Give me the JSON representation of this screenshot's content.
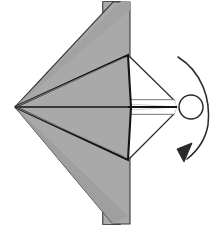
{
  "figure": {
    "title": "Origami paper-airplane fold step with rotation arrow",
    "canvas": {
      "width": 220,
      "height": 235,
      "background": "#ffffff"
    },
    "colors": {
      "paper_front_gray": "#a9a9a9",
      "paper_mid_gray": "#9c9c9c",
      "paper_shadow_gray": "#8f8f8f",
      "paper_back_white": "#ffffff",
      "outline_dark": "#1a1a1a",
      "outline_soft": "#555555",
      "crease_light": "#c9c9c9",
      "arrow_stroke": "#2a2a2a"
    },
    "elements": {
      "back_flap_band": {
        "label": "vertical back flap band",
        "points": "103,2 120,2 120,224 103,224"
      },
      "back_flap_band_shade": {
        "label": "vertical back flap band inner shade",
        "points": "103,2 116,2 116,224 103,224"
      },
      "upper_wing": {
        "label": "upper large gray wing",
        "points": "15,107 113,2 129,2 129,55"
      },
      "lower_wing": {
        "label": "lower large gray wing",
        "points": "15,107 129,160 129,224 113,224"
      },
      "upper_body_panel": {
        "label": "upper gray body panel",
        "points": "15,107 128,55 130,107"
      },
      "lower_body_panel": {
        "label": "lower gray body panel",
        "points": "15,107 130,107 128,160"
      },
      "nose_white_upper": {
        "label": "upper white inner nose panel",
        "points": "128,55 172,98 130,98"
      },
      "nose_white_lower": {
        "label": "lower white inner nose panel",
        "points": "128,160 130,116 172,116"
      },
      "nose_white_mid_upper": {
        "label": "upper thin white sliver",
        "points": "130,98 172,98 175,107 130,104"
      },
      "nose_white_mid_lower": {
        "label": "lower thin white sliver",
        "points": "130,110 175,107 172,116 130,116"
      },
      "center_axis_line": {
        "label": "horizontal center fold line",
        "from": [
          15,
          107
        ],
        "to": [
          176,
          107
        ]
      },
      "rotation_circle": {
        "label": "rotation axis circle",
        "cx": 191,
        "cy": 107,
        "r": 12
      },
      "rotation_arrow": {
        "label": "curved rotation arrow",
        "path": "M 178,57 C 203,72 211,100 208,126 C 205,143 196,152 186,158",
        "head_points": "186,158 190,142 175,148"
      }
    }
  }
}
